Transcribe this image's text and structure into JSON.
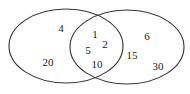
{
  "diagram": {
    "type": "venn",
    "sets": [
      {
        "name": "left-set",
        "cx": 66,
        "cy": 46,
        "rx": 57,
        "ry": 37
      },
      {
        "name": "right-set",
        "cx": 127,
        "cy": 47,
        "rx": 57,
        "ry": 37
      }
    ],
    "stroke_color": "#333333",
    "labels": [
      {
        "region": "left-only",
        "text": "4",
        "x": 61,
        "y": 32
      },
      {
        "region": "left-only",
        "text": "20",
        "x": 48,
        "y": 66
      },
      {
        "region": "intersection",
        "text": "1",
        "x": 95,
        "y": 38
      },
      {
        "region": "intersection",
        "text": "5",
        "x": 88,
        "y": 54
      },
      {
        "region": "intersection",
        "text": "2",
        "x": 105,
        "y": 48
      },
      {
        "region": "intersection",
        "text": "10",
        "x": 97,
        "y": 68
      },
      {
        "region": "right-only",
        "text": "6",
        "x": 147,
        "y": 40
      },
      {
        "region": "right-only",
        "text": "15",
        "x": 132,
        "y": 59
      },
      {
        "region": "right-only",
        "text": "30",
        "x": 158,
        "y": 70
      }
    ]
  }
}
